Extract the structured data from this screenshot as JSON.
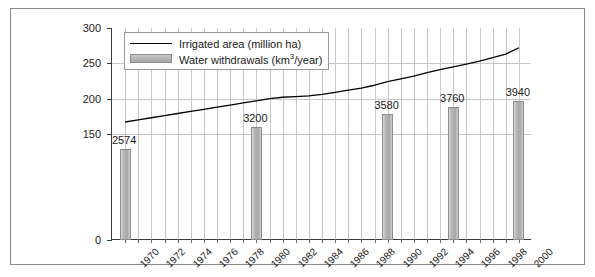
{
  "chart_data": {
    "type": "bar",
    "title": "",
    "subtitle": "",
    "xlabel": "",
    "ylabel": "",
    "xlim": [
      1969,
      2001
    ],
    "ylim": [
      0,
      300
    ],
    "yticks": [
      0,
      150,
      200,
      250,
      300
    ],
    "ytick_labels": [
      "0",
      "150",
      "200",
      "250",
      "300"
    ],
    "grid": "both",
    "legend_position": "top-left-inside",
    "categories": [
      1970,
      1971,
      1972,
      1973,
      1974,
      1975,
      1976,
      1977,
      1978,
      1979,
      1980,
      1981,
      1982,
      1983,
      1984,
      1985,
      1986,
      1987,
      1988,
      1989,
      1990,
      1991,
      1992,
      1993,
      1994,
      1995,
      1996,
      1997,
      1998,
      1999,
      2000
    ],
    "xtick_labels": [
      "1970",
      "1972",
      "1974",
      "1976",
      "1978",
      "1980",
      "1982",
      "1984",
      "1986",
      "1988",
      "1990",
      "1992",
      "1994",
      "1996",
      "1998",
      "2000"
    ],
    "xtick_years": [
      1970,
      1972,
      1974,
      1976,
      1978,
      1980,
      1982,
      1984,
      1986,
      1988,
      1990,
      1992,
      1994,
      1996,
      1998,
      2000
    ],
    "series": [
      {
        "name": "Irrigated area (million ha)",
        "type": "line",
        "unit": "million ha",
        "color": "#000000",
        "x": [
          1970,
          1971,
          1972,
          1973,
          1974,
          1975,
          1976,
          1977,
          1978,
          1979,
          1980,
          1981,
          1982,
          1983,
          1984,
          1985,
          1986,
          1987,
          1988,
          1989,
          1990,
          1991,
          1992,
          1993,
          1994,
          1995,
          1996,
          1997,
          1998,
          1999,
          2000
        ],
        "values": [
          167,
          170,
          173,
          176,
          179,
          182,
          185,
          188,
          191,
          194,
          197,
          200,
          202,
          203,
          204,
          206,
          209,
          212,
          215,
          219,
          224,
          228,
          232,
          237,
          241,
          245,
          249,
          253,
          258,
          263,
          272
        ]
      },
      {
        "name": "Water withdrawals (km<sup>3</sup>/year)",
        "name_plain": "Water withdrawals (km3/year)",
        "type": "bar",
        "unit": "km3/year",
        "color": "#b0b0b0",
        "x": [
          1970,
          1980,
          1990,
          1995,
          2000
        ],
        "values": [
          2574,
          3200,
          3580,
          3760,
          3940
        ],
        "labels": [
          "2574",
          "3200",
          "3580",
          "3760",
          "3940"
        ],
        "value_axis_scale_note": "bars plotted against same 0-300 axis using value/20 scaling"
      }
    ]
  },
  "legend": {
    "entries": [
      {
        "label_prefix": "Irrigated area (million ha)",
        "marker": "line"
      },
      {
        "label_prefix": "Water withdrawals (km",
        "label_sup": "3",
        "label_suffix": "/year)",
        "marker": "bar-swatch"
      }
    ]
  }
}
